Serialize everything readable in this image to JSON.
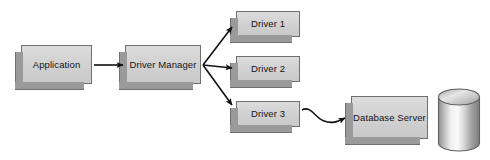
{
  "diagram": {
    "type": "block-flow-diagram",
    "background_color": "#ffffff",
    "box_fill_color": "#d4d4d4",
    "box_border_color": "#6f6f6f",
    "box_shadow_color": "#9a9a9a",
    "connector_color": "#111111",
    "nodes": [
      {
        "id": "application",
        "label": "Application",
        "shape": "box-3d"
      },
      {
        "id": "driver_manager",
        "label": "Driver Manager",
        "shape": "box-3d"
      },
      {
        "id": "driver_1",
        "label": "Driver 1",
        "shape": "box-3d"
      },
      {
        "id": "driver_2",
        "label": "Driver 2",
        "shape": "box-3d"
      },
      {
        "id": "driver_3",
        "label": "Driver 3",
        "shape": "box-3d"
      },
      {
        "id": "database_server",
        "label": "Database Server",
        "shape": "box-3d"
      },
      {
        "id": "database_disk",
        "label": "",
        "shape": "cylinder"
      }
    ],
    "edges": [
      {
        "from": "application",
        "to": "driver_manager",
        "style": "straight-arrow"
      },
      {
        "from": "driver_manager",
        "to": "driver_1",
        "style": "straight-arrow"
      },
      {
        "from": "driver_manager",
        "to": "driver_2",
        "style": "straight-arrow"
      },
      {
        "from": "driver_manager",
        "to": "driver_3",
        "style": "straight-arrow"
      },
      {
        "from": "driver_3",
        "to": "database_server",
        "style": "wavy-arrow"
      }
    ]
  }
}
